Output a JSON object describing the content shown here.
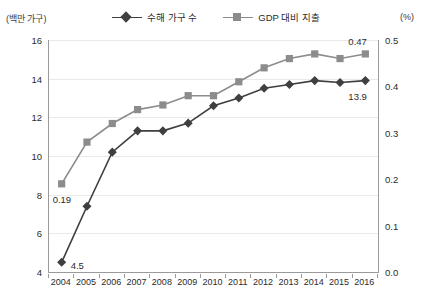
{
  "axis_units": {
    "left": "(백만 가구)",
    "right": "(%)"
  },
  "legend": [
    {
      "label": "수해 가구 수",
      "marker": "diamond-marker-icon",
      "color": "#3f3f3f"
    },
    {
      "label": "GDP 대비 지출",
      "marker": "square-marker-icon",
      "color": "#8c8c8c"
    }
  ],
  "annotations": [
    {
      "text": "0.19",
      "series": "GDP 대비 지출",
      "year": "2004"
    },
    {
      "text": "4.5",
      "series": "수혜 가구 수",
      "year": "2004"
    },
    {
      "text": "0.47",
      "series": "GDP 대비 지출",
      "year": "2016"
    },
    {
      "text": "13.9",
      "series": "수혜 가구 수",
      "year": "2016"
    }
  ],
  "chart_data": {
    "type": "line",
    "title": "",
    "xlabel": "",
    "ylabel": "(백만 가구)",
    "y2label": "(%)",
    "grid": true,
    "legend_position": "top",
    "categories": [
      "2004",
      "2005",
      "2006",
      "2007",
      "2008",
      "2009",
      "2010",
      "2011",
      "2012",
      "2013",
      "2014",
      "2015",
      "2016"
    ],
    "ylim": [
      4,
      16
    ],
    "yticks": [
      "4",
      "6",
      "8",
      "10",
      "12",
      "14",
      "16"
    ],
    "y2lim": [
      0.0,
      0.5
    ],
    "y2ticks": [
      "0.0",
      "0.1",
      "0.2",
      "0.3",
      "0.4",
      "0.5"
    ],
    "series": [
      {
        "name": "수해 가구 수",
        "axis": "left",
        "color": "#3f3f3f",
        "marker": "diamond",
        "values": [
          4.5,
          7.4,
          10.2,
          11.3,
          11.3,
          11.7,
          12.6,
          13.0,
          13.5,
          13.7,
          13.9,
          13.8,
          13.9
        ]
      },
      {
        "name": "GDP 대비 지출",
        "axis": "right",
        "color": "#8c8c8c",
        "marker": "square",
        "values": [
          0.19,
          0.28,
          0.32,
          0.35,
          0.36,
          0.38,
          0.38,
          0.41,
          0.44,
          0.46,
          0.47,
          0.46,
          0.47
        ]
      }
    ]
  }
}
